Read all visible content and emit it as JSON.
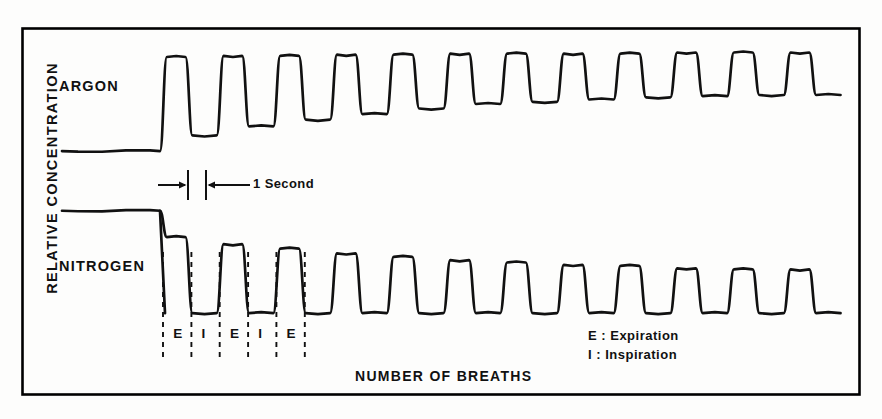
{
  "figure": {
    "axis": {
      "ylabel": "RELATIVE CONCENTRATION",
      "xlabel": "NUMBER OF BREATHS"
    },
    "trace_labels": {
      "argon": "ARGON",
      "nitrogen": "NITROGEN"
    },
    "scale_bar": {
      "label": "1 Second"
    },
    "phase_markers": {
      "sequence": [
        "E",
        "I",
        "E",
        "I",
        "E"
      ]
    },
    "legend": {
      "expiration": "E : Expiration",
      "inspiration": "I : Inspiration"
    },
    "colors": {
      "ink": "#111111",
      "paper": "#fdfdfc",
      "frame": "#000000"
    }
  },
  "chart_data": {
    "type": "line",
    "title": "",
    "xlabel": "NUMBER OF BREATHS",
    "ylabel": "RELATIVE CONCENTRATION",
    "xlim": [
      0,
      13.2
    ],
    "ylim": [
      0,
      1
    ],
    "grid": false,
    "legend_position": "bottom-right",
    "annotations": [
      {
        "text": "1 Second",
        "type": "scale-bar",
        "x_start": 5.0,
        "x_end": 5.55
      },
      {
        "text": "E",
        "type": "phase",
        "meaning": "Expiration"
      },
      {
        "text": "I",
        "type": "phase",
        "meaning": "Inspiration"
      }
    ],
    "series": [
      {
        "name": "ARGON",
        "description": "Argon wash-in: flat baseline then square-wave oscillations, troughs rising breath by breath",
        "baseline": 0.08,
        "breath_count": 12,
        "peaks": [
          0.92,
          0.93,
          0.93,
          0.94,
          0.94,
          0.95,
          0.95,
          0.95,
          0.95,
          0.96,
          0.96,
          0.96
        ],
        "troughs": [
          0.22,
          0.3,
          0.36,
          0.41,
          0.46,
          0.5,
          0.52,
          0.54,
          0.56,
          0.57,
          0.58,
          0.58
        ]
      },
      {
        "name": "NITROGEN",
        "description": "Nitrogen wash-out: flat high baseline then square-wave oscillations, peaks falling breath by breath",
        "baseline": 0.95,
        "breath_count": 12,
        "peaks": [
          0.72,
          0.66,
          0.62,
          0.58,
          0.55,
          0.52,
          0.5,
          0.48,
          0.47,
          0.45,
          0.44,
          0.44
        ],
        "troughs": [
          0.06,
          0.06,
          0.06,
          0.06,
          0.06,
          0.06,
          0.06,
          0.06,
          0.06,
          0.06,
          0.06,
          0.06
        ]
      }
    ]
  }
}
